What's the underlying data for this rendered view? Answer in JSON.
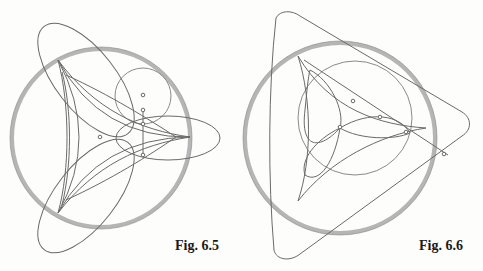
{
  "figures": [
    {
      "id": "fig-6-5",
      "caption": "Fig. 6.5"
    },
    {
      "id": "fig-6-6",
      "caption": "Fig. 6.6"
    }
  ],
  "colors": {
    "line": "#6a6a6a",
    "thick_circle": "#b8b8b8",
    "background": "#fdfdfb"
  }
}
